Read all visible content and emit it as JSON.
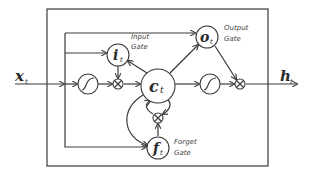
{
  "diagram": {
    "input": {
      "symbol": "x",
      "subscript": "t"
    },
    "output": {
      "symbol": "h",
      "subscript": "t"
    },
    "cell_state": {
      "symbol": "c",
      "subscript": "t"
    },
    "gates": [
      {
        "id": "input",
        "symbol": "i",
        "subscript": "t",
        "label_line1": "Input",
        "label_line2": "Gate"
      },
      {
        "id": "output",
        "symbol": "o",
        "subscript": "t",
        "label_line1": "Output",
        "label_line2": "Gate"
      },
      {
        "id": "forget",
        "symbol": "f",
        "subscript": "t",
        "label_line1": "Forget",
        "label_line2": "Gate"
      }
    ],
    "colors": {
      "stroke": "#3a3a3a",
      "background": "#ffffff"
    }
  }
}
